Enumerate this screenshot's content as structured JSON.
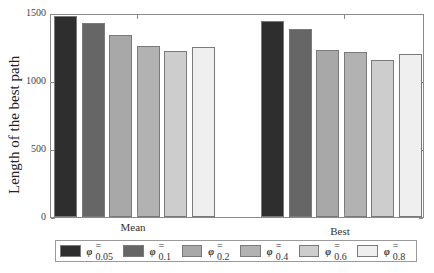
{
  "chart_data": {
    "type": "bar",
    "title": "",
    "xlabel": "",
    "ylabel": "Length of the best path",
    "ylim": [
      0,
      1500
    ],
    "yticks": [
      0,
      500,
      1000,
      1500
    ],
    "grid": false,
    "legend_position": "bottom",
    "categories": [
      "Mean",
      "Best"
    ],
    "series": [
      {
        "name": "φ = 0.05",
        "color": "#2e2e2e",
        "values": [
          1480,
          1440
        ]
      },
      {
        "name": "φ = 0.1",
        "color": "#666666",
        "values": [
          1430,
          1380
        ]
      },
      {
        "name": "φ = 0.2",
        "color": "#a8a8a8",
        "values": [
          1340,
          1225
        ]
      },
      {
        "name": "φ = 0.4",
        "color": "#b2b2b2",
        "values": [
          1255,
          1210
        ]
      },
      {
        "name": "φ = 0.6",
        "color": "#cdcdcd",
        "values": [
          1220,
          1155
        ]
      },
      {
        "name": "φ = 0.8",
        "color": "#efefef",
        "values": [
          1248,
          1195
        ]
      }
    ]
  },
  "axis": {
    "ylabel": "Length of the best path",
    "ytick_labels": [
      "1500",
      "1000",
      "500",
      "0"
    ],
    "xtick_labels": [
      "Mean",
      "Best"
    ]
  },
  "legend": {
    "symbol": "φ",
    "items": [
      {
        "label": "= 0.05",
        "color": "#2e2e2e"
      },
      {
        "label": "= 0.1",
        "color": "#666666"
      },
      {
        "label": "= 0.2",
        "color": "#a8a8a8"
      },
      {
        "label": "= 0.4",
        "color": "#b2b2b2"
      },
      {
        "label": "= 0.6",
        "color": "#cdcdcd"
      },
      {
        "label": "= 0.8",
        "color": "#efefef"
      }
    ]
  }
}
